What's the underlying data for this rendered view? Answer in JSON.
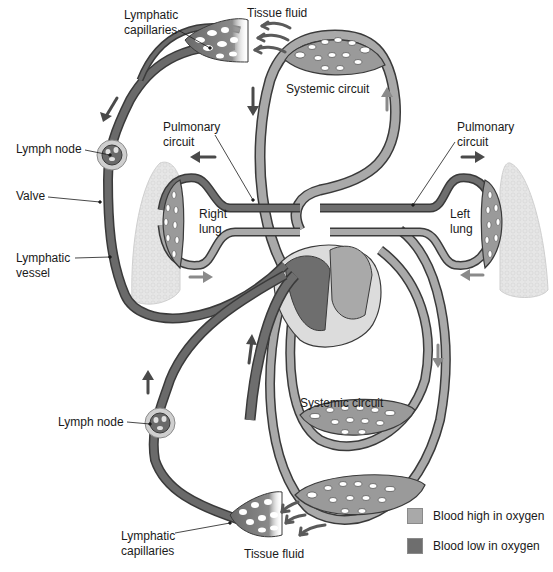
{
  "diagram": {
    "labels": {
      "lymphatic_capillaries_top": "Lymphatic\ncapillaries",
      "tissue_fluid_top": "Tissue fluid",
      "systemic_circuit_top": "Systemic circuit",
      "pulmonary_circuit_left": "Pulmonary\ncircuit",
      "pulmonary_circuit_right": "Pulmonary\ncircuit",
      "lymph_node_top": "Lymph node",
      "valve": "Valve",
      "lymphatic_vessel": "Lymphatic\nvessel",
      "right_lung": "Right\nlung",
      "left_lung": "Left\nlung",
      "systemic_circuit_bottom": "Systemic circuit",
      "lymph_node_bottom": "Lymph node",
      "lymphatic_capillaries_bottom": "Lymphatic\ncapillaries",
      "tissue_fluid_bottom": "Tissue fluid"
    },
    "legend": [
      {
        "label": "Blood high in oxygen",
        "color": "#a9a9a9"
      },
      {
        "label": "Blood low in oxygen",
        "color": "#6e6e6e"
      }
    ],
    "colors": {
      "oxygen_high": "#a9a9a9",
      "oxygen_low": "#6e6e6e",
      "lymph": "#6a6a6a",
      "outline": "#3a3a3a",
      "lung_tissue": "#e4e4e4",
      "arrow_dark": "#4a4a4a",
      "arrow_light": "#8a8a8a"
    }
  }
}
